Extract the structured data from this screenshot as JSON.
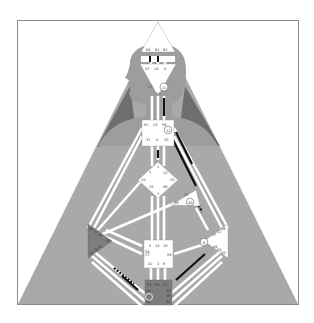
{
  "diagram": {
    "type": "human-design-bodygraph",
    "colors": {
      "background": "#ffffff",
      "frame": "#8a8a8a",
      "triangle_fill": "#a9a9a9",
      "silhouette": "#9d9d9d",
      "shoulder_shadow": "#6e6e6e",
      "center_undefined": "#ffffff",
      "center_defined": "#7d7d7d",
      "channel_open": "#ffffff",
      "channel_active": "#111111",
      "gate_label": "#333333"
    },
    "centers": [
      {
        "name": "head",
        "shape": "triangle-up",
        "defined": false,
        "gates": [
          "64",
          "61",
          "63"
        ]
      },
      {
        "name": "ajna",
        "shape": "triangle-down",
        "defined": false,
        "gates": [
          "47",
          "24",
          "4",
          "17",
          "43",
          "11"
        ]
      },
      {
        "name": "throat",
        "shape": "square",
        "defined": false,
        "gates": [
          "62",
          "23",
          "56",
          "35",
          "12",
          "45",
          "33",
          "8",
          "31",
          "20",
          "16"
        ]
      },
      {
        "name": "g-center",
        "shape": "diamond",
        "defined": false,
        "gates": [
          "1",
          "13",
          "25",
          "46",
          "2",
          "15",
          "10",
          "7"
        ]
      },
      {
        "name": "heart",
        "shape": "triangle",
        "defined": false,
        "gates": [
          "21",
          "51",
          "26",
          "40"
        ]
      },
      {
        "name": "spleen",
        "shape": "triangle-right",
        "defined": true,
        "gates": [
          "48",
          "57",
          "44",
          "50",
          "32",
          "28",
          "18"
        ]
      },
      {
        "name": "solar-plexus",
        "shape": "triangle-left",
        "defined": false,
        "gates": [
          "36",
          "22",
          "37",
          "6",
          "49",
          "55",
          "30"
        ]
      },
      {
        "name": "sacral",
        "shape": "square",
        "defined": false,
        "gates": [
          "5",
          "14",
          "29",
          "34",
          "27",
          "59",
          "42",
          "3",
          "9"
        ]
      },
      {
        "name": "root",
        "shape": "square",
        "defined": true,
        "gates": [
          "53",
          "60",
          "52",
          "54",
          "38",
          "58",
          "19",
          "39",
          "41"
        ]
      }
    ],
    "circled_gates": [
      "11",
      "12",
      "40",
      "6",
      "41"
    ]
  }
}
